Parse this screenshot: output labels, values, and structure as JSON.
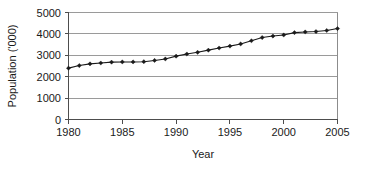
{
  "chart_data": {
    "type": "line",
    "title": "",
    "xlabel": "Year",
    "ylabel": "Population ('000)",
    "xlim": [
      1980,
      2005
    ],
    "ylim": [
      0,
      5000
    ],
    "xticks": [
      1980,
      1985,
      1990,
      1995,
      2000,
      2005
    ],
    "yticks": [
      0,
      1000,
      2000,
      3000,
      4000,
      5000
    ],
    "grid": "horizontal",
    "legend": "none",
    "marker": "diamond",
    "line_color": "#1a1a1a",
    "grid_color": "#9a9a9a",
    "axis_color": "#4d4d4d",
    "x": [
      1980,
      1981,
      1982,
      1983,
      1984,
      1985,
      1986,
      1987,
      1988,
      1989,
      1990,
      1991,
      1992,
      1993,
      1994,
      1995,
      1996,
      1997,
      1998,
      1999,
      2000,
      2001,
      2002,
      2003,
      2004,
      2005
    ],
    "values": [
      2400,
      2520,
      2600,
      2640,
      2680,
      2690,
      2690,
      2700,
      2760,
      2830,
      2960,
      3060,
      3140,
      3240,
      3340,
      3430,
      3530,
      3680,
      3830,
      3900,
      3950,
      4060,
      4090,
      4110,
      4160,
      4250
    ],
    "series": [
      {
        "name": "Population",
        "values": [
          2400,
          2520,
          2600,
          2640,
          2680,
          2690,
          2690,
          2700,
          2760,
          2830,
          2960,
          3060,
          3140,
          3240,
          3340,
          3430,
          3530,
          3680,
          3830,
          3900,
          3950,
          4060,
          4090,
          4110,
          4160,
          4250
        ]
      }
    ]
  },
  "axis": {
    "y_tick_labels": [
      "5000",
      "4000",
      "3000",
      "2000",
      "1000",
      "0"
    ],
    "x_tick_labels": [
      "1980",
      "1985",
      "1990",
      "1995",
      "2000",
      "2005"
    ],
    "y_title": "Population ('000)",
    "x_title": "Year"
  }
}
